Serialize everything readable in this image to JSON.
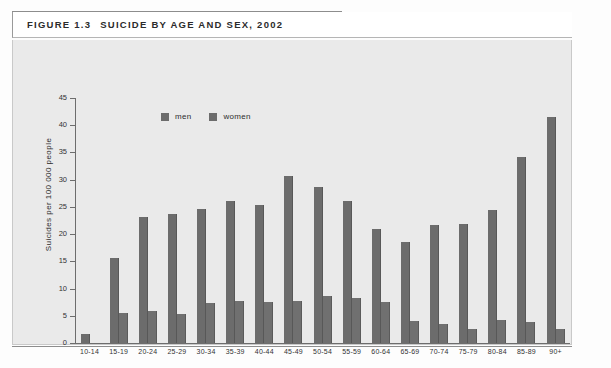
{
  "figure": {
    "number": "FIGURE 1.3",
    "title": "SUICIDE BY AGE AND SEX, 2002"
  },
  "chart_data": {
    "type": "bar",
    "title": "SUICIDE BY AGE AND SEX, 2002",
    "xlabel": "Age cohort",
    "ylabel": "Suicides per 100 000 people",
    "ylim": [
      0,
      45
    ],
    "yticks": [
      0,
      5,
      10,
      15,
      20,
      25,
      30,
      35,
      40,
      45
    ],
    "grid": false,
    "legend_position": "top-left-inside",
    "categories": [
      "10-14",
      "15-19",
      "20-24",
      "25-29",
      "30-34",
      "35-39",
      "40-44",
      "45-49",
      "50-54",
      "55-59",
      "60-64",
      "65-69",
      "70-74",
      "75-79",
      "80-84",
      "85-89",
      "90+"
    ],
    "series": [
      {
        "name": "men",
        "color": "#6c6c6c",
        "values": [
          1.7,
          15.6,
          23.1,
          23.7,
          24.6,
          26.0,
          25.4,
          30.6,
          28.6,
          26.1,
          21.0,
          18.5,
          21.6,
          21.9,
          24.5,
          34.2,
          41.6
        ]
      },
      {
        "name": "women",
        "color": "#707070",
        "values": [
          0.0,
          5.6,
          5.8,
          5.4,
          7.3,
          7.8,
          7.6,
          7.7,
          8.7,
          8.2,
          7.6,
          4.1,
          3.5,
          2.5,
          4.3,
          3.9,
          2.6
        ]
      }
    ]
  }
}
